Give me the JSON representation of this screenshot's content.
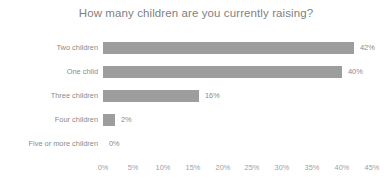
{
  "chart_data": {
    "type": "bar",
    "orientation": "horizontal",
    "title": "How many children are you currently raising?",
    "xlabel": "",
    "ylabel": "",
    "categories": [
      "Two children",
      "One child",
      "Three children",
      "Four children",
      "Five or more children"
    ],
    "values": [
      42,
      40,
      16,
      2,
      0
    ],
    "data_labels": [
      "42%",
      "40%",
      "16%",
      "2%",
      "0%"
    ],
    "xlim": [
      0,
      45
    ],
    "xticks": [
      0,
      5,
      10,
      15,
      20,
      25,
      30,
      35,
      40,
      45
    ],
    "xtick_labels": [
      "0%",
      "5%",
      "10%",
      "15%",
      "20%",
      "25%",
      "30%",
      "35%",
      "40%",
      "45%"
    ],
    "grid": false,
    "legend": false,
    "bar_color": "#9d9d9d",
    "title_color": "#7f7f7f",
    "label_color": "#8a8a8a",
    "tick_color": "#a0a0a0",
    "background_color": "#ffffff"
  }
}
